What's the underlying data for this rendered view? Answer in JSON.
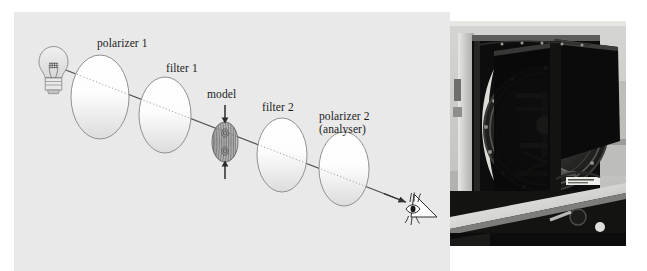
{
  "figure": {
    "type": "optical-setup-diagram-with-photograph",
    "background_color": "#ffffff",
    "panel_color": "#e9e9e9"
  },
  "diagram": {
    "title": "",
    "labels": {
      "polarizer1": "polarizer 1",
      "filter1": "filter 1",
      "model": "model",
      "filter2": "filter 2",
      "polarizer2_line1": "polarizer 2",
      "polarizer2_line2": "(analyser)"
    },
    "components": [
      {
        "name": "light-source",
        "icon": "light-bulb-icon",
        "label": ""
      },
      {
        "name": "polarizer-1",
        "icon": "ellipse-optical-element",
        "label": "polarizer 1"
      },
      {
        "name": "filter-1",
        "icon": "ellipse-optical-element",
        "label": "filter 1"
      },
      {
        "name": "model",
        "icon": "fringe-specimen-icon",
        "label": "model"
      },
      {
        "name": "filter-2",
        "icon": "ellipse-optical-element",
        "label": "filter 2"
      },
      {
        "name": "polarizer-2",
        "icon": "ellipse-optical-element",
        "label": "polarizer 2 (analyser)"
      },
      {
        "name": "observer-eye",
        "icon": "eye-icon",
        "label": ""
      }
    ],
    "light_ray": {
      "style": "solid outside elements, dotted inside elements",
      "direction": "from light source down-right to eye",
      "arrowhead": "at observer eye"
    },
    "load_arrows": {
      "top": "downward compression arrow above model",
      "bottom": "upward compression arrow below model"
    },
    "colors": {
      "ink": "#4a4a4a",
      "text": "#1b1b1b",
      "element_fill_top": "#ffffff",
      "element_fill_bottom": "#dcdcdc"
    }
  },
  "photograph": {
    "name": "polariscope-apparatus-photo",
    "caption": "",
    "description_hidden": "",
    "palette": {
      "backdrop": "#c9c9c7",
      "frame_dark": "#0e0e0e",
      "metal_light": "#d8d8d4",
      "bench_dark": "#141414"
    }
  }
}
